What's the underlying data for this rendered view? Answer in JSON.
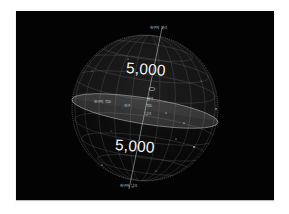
{
  "diagram": {
    "labels": {
      "north_pole": "천구의 북극",
      "south_pole": "천구의 남극",
      "equator": "천구의 적도",
      "center_top": "북극",
      "center_mid_left": "지구",
      "center_mid_right": "적도",
      "center_bottom": "남극"
    },
    "label_readability": "uncertain: small labels too blurry to read; Korean text inferred from diagram type",
    "northern_hemisphere_value": "5,000",
    "southern_hemisphere_value": "5,000"
  },
  "colors": {
    "background": "#030303",
    "page": "#ffffff",
    "grid": "#9a9a9a",
    "text": "#f4f4f4"
  }
}
